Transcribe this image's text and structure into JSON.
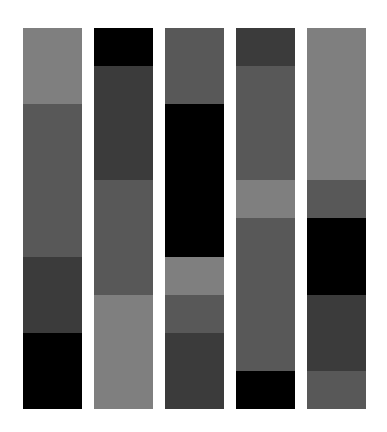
{
  "palette": {
    "black": "#000000",
    "dark": "#3b3b3b",
    "medium": "#585858",
    "light": "#7f7f7f"
  },
  "unit_px": 38.1,
  "columns": [
    {
      "x": 23,
      "blocks": [
        {
          "shade": "light",
          "units": 2
        },
        {
          "shade": "medium",
          "units": 4
        },
        {
          "shade": "dark",
          "units": 2
        },
        {
          "shade": "black",
          "units": 2
        }
      ]
    },
    {
      "x": 94,
      "blocks": [
        {
          "shade": "black",
          "units": 1
        },
        {
          "shade": "dark",
          "units": 3
        },
        {
          "shade": "medium",
          "units": 3
        },
        {
          "shade": "light",
          "units": 3
        }
      ]
    },
    {
      "x": 165,
      "blocks": [
        {
          "shade": "medium",
          "units": 2
        },
        {
          "shade": "black",
          "units": 4
        },
        {
          "shade": "light",
          "units": 1
        },
        {
          "shade": "medium",
          "units": 1
        },
        {
          "shade": "dark",
          "units": 2
        }
      ]
    },
    {
      "x": 236,
      "blocks": [
        {
          "shade": "dark",
          "units": 1
        },
        {
          "shade": "medium",
          "units": 3
        },
        {
          "shade": "light",
          "units": 1
        },
        {
          "shade": "medium",
          "units": 4
        },
        {
          "shade": "black",
          "units": 1
        }
      ]
    },
    {
      "x": 307,
      "blocks": [
        {
          "shade": "light",
          "units": 4
        },
        {
          "shade": "medium",
          "units": 1
        },
        {
          "shade": "black",
          "units": 2
        },
        {
          "shade": "dark",
          "units": 2
        },
        {
          "shade": "medium",
          "units": 1
        }
      ]
    }
  ]
}
